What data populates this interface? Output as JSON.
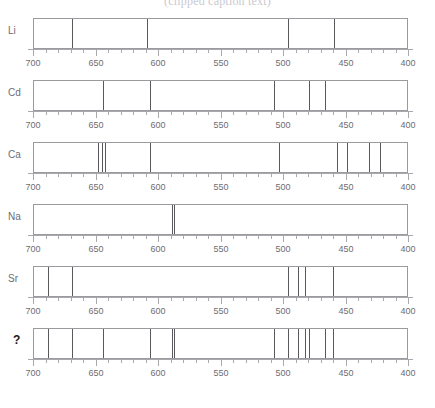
{
  "title": "(clipped caption text)",
  "chart_data": {
    "type": "line",
    "xlabel": "Wavelength (nm)",
    "ylabel": "",
    "xlim": [
      700,
      400
    ],
    "axis_reversed": true,
    "grid": false,
    "legend": "none",
    "major_tick_step": 50,
    "minor_tick_step": 10,
    "tick_labels": [
      "700",
      "650",
      "600",
      "550",
      "500",
      "450",
      "400"
    ],
    "tick_values": [
      700,
      650,
      600,
      550,
      500,
      450,
      400
    ],
    "line_color": "#58585d",
    "box_color": "#9a9a9f",
    "axis_color": "#a8a8ad",
    "label_color": "#6d6d72",
    "series": [
      {
        "name": "Li",
        "label": "Li",
        "unknown": false,
        "values": [
          670,
          610,
          497,
          460
        ]
      },
      {
        "name": "Cd",
        "label": "Cd",
        "unknown": false,
        "values": [
          645,
          607,
          508,
          480,
          467
        ]
      },
      {
        "name": "Ca",
        "label": "Ca",
        "unknown": false,
        "values": [
          649,
          646,
          643,
          607,
          504,
          458,
          450,
          432,
          423,
          401,
          399
        ]
      },
      {
        "name": "Na",
        "label": "Na",
        "unknown": false,
        "values": [
          590,
          588
        ]
      },
      {
        "name": "Sr",
        "label": "Sr",
        "unknown": false,
        "values": [
          689,
          670,
          497,
          489,
          483,
          461
        ]
      },
      {
        "name": "Unknown",
        "label": "?",
        "unknown": true,
        "values": [
          689,
          670,
          645,
          607,
          590,
          588,
          508,
          497,
          489,
          483,
          480,
          467,
          461
        ]
      }
    ]
  }
}
